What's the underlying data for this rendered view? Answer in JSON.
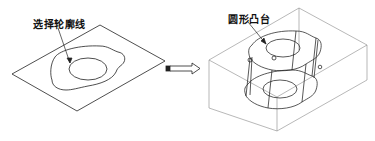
{
  "figure": {
    "left_panel": {
      "callout": "选择轮廓线",
      "description": "flat sketch plane with outer profile and inner circle"
    },
    "arrow": {
      "direction": "right"
    },
    "right_panel": {
      "callout": "圆形凸台",
      "description": "block with extruded circular boss, wireframe view"
    },
    "colors": {
      "line": "#222222",
      "light_line": "#888888",
      "background": "#ffffff"
    }
  }
}
